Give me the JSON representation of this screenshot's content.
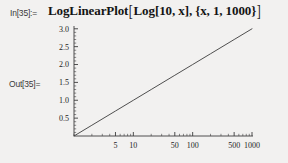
{
  "notebook": {
    "background_color": "#f2f1f0",
    "input_cell": {
      "label": "In[35]:=",
      "expression_head": "LogLinearPlot",
      "expression_body": "Log[10, x], {x, 1, 1000}",
      "expression_full": "LogLinearPlot[Log[10, x], {x, 1, 1000}]",
      "open_bracket": "[",
      "close_bracket": "]"
    },
    "output_cell": {
      "label": "Out[35]="
    }
  },
  "chart_data": {
    "type": "line",
    "title": "",
    "xlabel": "",
    "ylabel": "",
    "xscale": "log",
    "yscale": "linear",
    "xlim": [
      1,
      1000
    ],
    "ylim": [
      0,
      3.05
    ],
    "grid": false,
    "legend": false,
    "line_color": "#3c3c3c",
    "axis_color": "#3c3c3c",
    "x_ticks": [
      {
        "value": 5,
        "label": "5"
      },
      {
        "value": 10,
        "label": "10"
      },
      {
        "value": 50,
        "label": "50"
      },
      {
        "value": 100,
        "label": "100"
      },
      {
        "value": 500,
        "label": "500"
      },
      {
        "value": 1000,
        "label": "1000"
      }
    ],
    "y_ticks": [
      {
        "value": 0.5,
        "label": "0.5"
      },
      {
        "value": 1.0,
        "label": "1.0"
      },
      {
        "value": 1.5,
        "label": "1.5"
      },
      {
        "value": 2.0,
        "label": "2.0"
      },
      {
        "value": 2.5,
        "label": "2.5"
      },
      {
        "value": 3.0,
        "label": "3.0"
      }
    ],
    "series": [
      {
        "name": "Log[10, x]",
        "x": [
          1,
          2,
          5,
          10,
          20,
          50,
          100,
          200,
          500,
          1000
        ],
        "y": [
          0.0,
          0.301,
          0.699,
          1.0,
          1.301,
          1.699,
          2.0,
          2.301,
          2.699,
          3.0
        ]
      }
    ]
  }
}
